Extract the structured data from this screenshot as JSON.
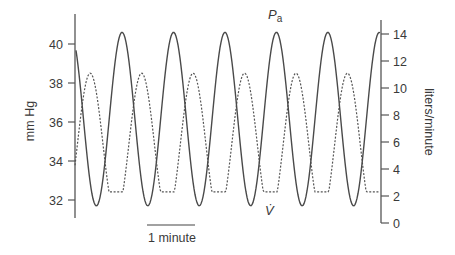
{
  "chart_data": {
    "type": "line",
    "title": "",
    "xlabel": "",
    "scale_bar": {
      "label": "1 minute",
      "length_minutes": 1
    },
    "left_axis": {
      "label": "mm Hg",
      "ticks": [
        32,
        34,
        36,
        38,
        40
      ],
      "range": [
        31,
        41.3
      ]
    },
    "right_axis": {
      "label": "liters/minute",
      "ticks": [
        0,
        2,
        4,
        6,
        8,
        10,
        12,
        14
      ],
      "range": [
        0,
        15
      ]
    },
    "grid": false,
    "legend": "inline labels",
    "series": [
      {
        "name": "Pa",
        "label_main": "P",
        "label_sub": "a",
        "axis": "left",
        "style": "solid",
        "description": "Arterial PCO2 oscillation (mm Hg)",
        "period_minutes": 1.05,
        "max": 40.6,
        "min": 31.7,
        "start_value": 38.9,
        "peak_times_min": [
          0.94,
          2.0,
          3.06,
          4.1,
          5.14,
          6.16
        ],
        "trough_times_min": [
          0.41,
          1.47,
          2.51,
          3.55,
          4.59,
          5.63
        ]
      },
      {
        "name": "V̇",
        "label_main": "V̇",
        "axis": "right",
        "style": "dashed",
        "description": "Ventilation (liters/minute), periodic breathing with clipped minima",
        "period_minutes": 1.05,
        "max": 11.1,
        "min_plateau": 2.3,
        "start_value": 5.7,
        "peak_times_min": [
          0.29,
          1.33,
          2.39,
          3.41,
          4.49,
          5.55
        ]
      }
    ]
  },
  "labels": {
    "left_axis_title": "mm Hg",
    "right_axis_title": "liters/minute",
    "pa_main": "P",
    "pa_sub": "a",
    "vdot": "V̇",
    "scale_bar": "1 minute"
  }
}
